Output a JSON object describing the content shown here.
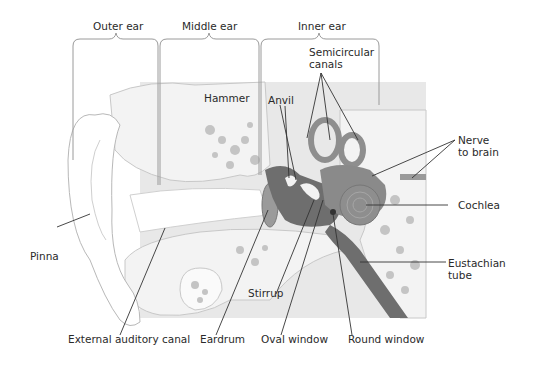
{
  "regions": {
    "outer": "Outer ear",
    "middle": "Middle ear",
    "inner": "Inner ear"
  },
  "labels": {
    "semicircular": "Semicircular\ncanals",
    "hammer": "Hammer",
    "anvil": "Anvil",
    "nerve": "Nerve\nto brain",
    "cochlea": "Cochlea",
    "pinna": "Pinna",
    "eustachian": "Eustachian\ntube",
    "stirrup": "Stirrup",
    "canal": "External auditory canal",
    "eardrum": "Eardrum",
    "oval": "Oval window",
    "round": "Round window"
  },
  "colors": {
    "bg_panel": "#e6e6e6",
    "bone": "#f2f2f2",
    "bone_spot": "#bdbdbd",
    "dark_tissue": "#6e6e6e",
    "inner_ear": "#8a8a8a",
    "line": "#2a2a2a"
  }
}
